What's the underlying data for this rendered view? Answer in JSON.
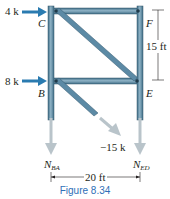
{
  "figure": {
    "caption": "Figure 8.34",
    "applied_loads": [
      {
        "label": "4 k",
        "joint": "C",
        "direction": "right"
      },
      {
        "label": "8 k",
        "joint": "B",
        "direction": "right"
      }
    ],
    "joints": {
      "C": "C",
      "F": "F",
      "B": "B",
      "E": "E"
    },
    "dimensions": {
      "height": "15 ft",
      "width": "20 ft"
    },
    "member_forces": {
      "diagonal": "−15 k",
      "left_label_main": "N",
      "left_label_sub": "BA",
      "right_label_main": "N",
      "right_label_sub": "ED"
    },
    "colors": {
      "member": "#4f7f9a",
      "member_highlight": "#8fb3c6",
      "load_arrow": "#2a7bb0",
      "force_arrow": "#b9c4ca",
      "caption": "#2e6fb7"
    }
  }
}
